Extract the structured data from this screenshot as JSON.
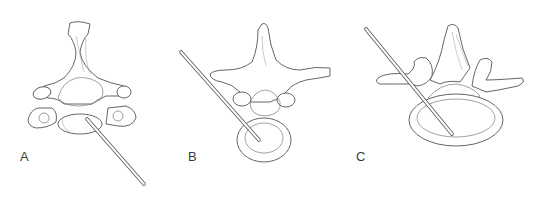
{
  "figure": {
    "panels": [
      {
        "label": "A",
        "label_pos": [
          20,
          150
        ],
        "description": "cervical vertebra, needle inserted from lower right into vertebral body",
        "needle": {
          "from": [
            144,
            184
          ],
          "to": [
            87,
            119
          ]
        }
      },
      {
        "label": "B",
        "label_pos": [
          188,
          150
        ],
        "description": "thoracic vertebra, needle inserted from upper left into vertebral body",
        "needle": {
          "from": [
            181,
            52
          ],
          "to": [
            259,
            140
          ]
        }
      },
      {
        "label": "C",
        "label_pos": [
          356,
          150
        ],
        "description": "lumbar vertebra, needle inserted from upper left into vertebral body",
        "needle": {
          "from": [
            366,
            29
          ],
          "to": [
            452,
            134
          ]
        }
      }
    ]
  }
}
